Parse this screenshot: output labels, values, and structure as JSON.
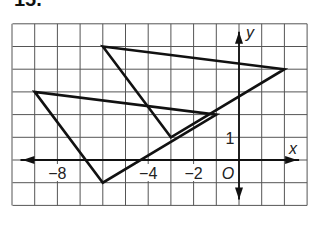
{
  "exercise": {
    "number": "15."
  },
  "graph": {
    "x_axis_label": "x",
    "y_axis_label": "y",
    "origin_label": "O",
    "x_tick_labels": [
      {
        "value": -8,
        "label": "−8"
      },
      {
        "value": -4,
        "label": "−4"
      },
      {
        "value": -2,
        "label": "−2"
      }
    ],
    "y_tick_labels": [
      {
        "value": 1,
        "label": "1"
      }
    ],
    "grid": {
      "x_min": -10,
      "x_max": 3,
      "y_min": -2,
      "y_max": 6,
      "step": 1
    },
    "colors": {
      "grid": "#555555",
      "axes": "#111111",
      "shapes": "#111111"
    },
    "triangles": [
      {
        "name": "triangle-1",
        "vertices": [
          [
            -6,
            5
          ],
          [
            2,
            4
          ],
          [
            -3,
            1
          ]
        ]
      },
      {
        "name": "triangle-2",
        "vertices": [
          [
            -9,
            3
          ],
          [
            -6,
            -1
          ],
          [
            -1,
            2
          ]
        ]
      }
    ]
  }
}
